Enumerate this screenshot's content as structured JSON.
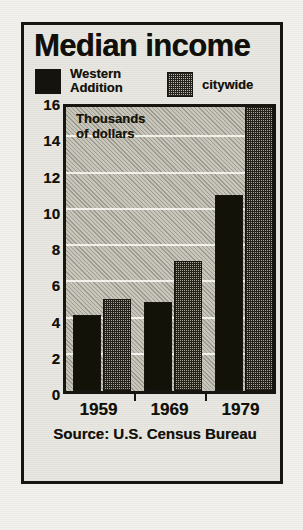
{
  "figure": {
    "title": "Median income",
    "annotation": "Thousands\nof dollars",
    "source": "Source: U.S. Census Bureau"
  },
  "legend": {
    "position": "top",
    "entries": [
      {
        "label": "Western\nAddition",
        "swatch": "solid-black",
        "color": "#131209"
      },
      {
        "label": "citywide",
        "swatch": "dotted-gray",
        "color": "#a8a599"
      }
    ]
  },
  "axes": {
    "y_ticks": [
      "16",
      "14",
      "12",
      "10",
      "8",
      "6",
      "4",
      "2",
      "0"
    ],
    "x_ticks": [
      "1959",
      "1969",
      "1979"
    ]
  },
  "chart_data": {
    "type": "bar",
    "title": "Median income",
    "subtitle": "",
    "xlabel": "",
    "ylabel": "Thousands of dollars",
    "annotations": [
      "Thousands of dollars",
      "Source: U.S. Census Bureau"
    ],
    "categories": [
      "1959",
      "1969",
      "1979"
    ],
    "series": [
      {
        "name": "Western Addition",
        "values": [
          4.2,
          4.9,
          10.8
        ],
        "color": "#131209"
      },
      {
        "name": "citywide",
        "values": [
          5.1,
          7.2,
          16.0
        ],
        "color": "#a8a599"
      }
    ],
    "ylim": [
      0,
      16
    ],
    "ytick_values": [
      0,
      2,
      4,
      6,
      8,
      10,
      12,
      14,
      16
    ],
    "grid": true,
    "legend_position": "top",
    "source": "Source: U.S. Census Bureau"
  }
}
